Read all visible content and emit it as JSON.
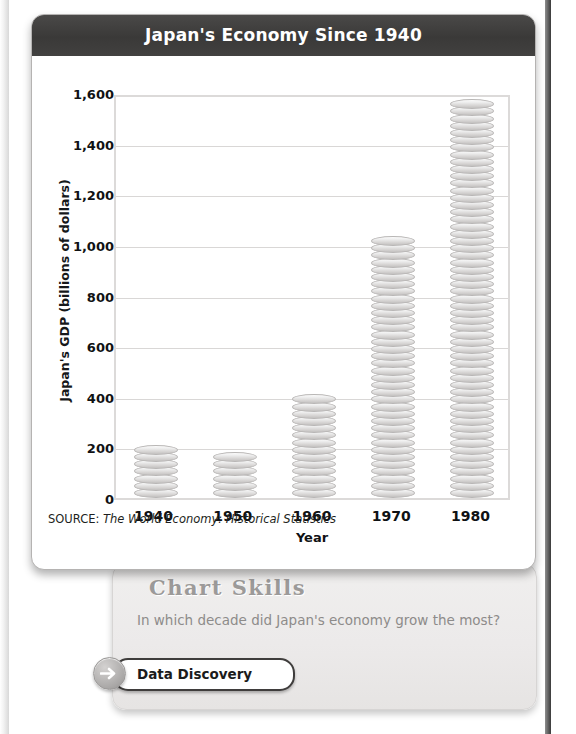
{
  "chart_card": {
    "title": "Japan's Economy Since 1940",
    "source_prefix": "SOURCE:",
    "source_title": "The World Economy: Historical Statistics"
  },
  "skills": {
    "heading": "Chart Skills",
    "question": "In which decade did Japan's economy grow the most?",
    "button_label": "Data Discovery",
    "arrow_icon": "arrow-right-icon"
  },
  "colors": {
    "title_bar": "#3a3938",
    "coin": "#d6d4d3",
    "gridline": "#d9d7d6",
    "panel": "#eceaea"
  },
  "chart_data": {
    "type": "bar",
    "title": "Japan's Economy Since 1940",
    "categories": [
      "1940",
      "1950",
      "1960",
      "1970",
      "1980"
    ],
    "values": [
      200,
      160,
      380,
      1010,
      1570
    ],
    "xlabel": "Year",
    "ylabel": "Japan's GDP (billions of dollars)",
    "ylim": [
      0,
      1600
    ],
    "yticks": [
      0,
      200,
      400,
      600,
      800,
      1000,
      1200,
      1400,
      1600
    ],
    "ytick_labels": [
      "0",
      "200",
      "400",
      "600",
      "800",
      "1,000",
      "1,200",
      "1,400",
      "1,600"
    ],
    "grid": true,
    "legend": null,
    "bar_style": "stacked-coins",
    "units": "billions of dollars",
    "source": "The World Economy: Historical Statistics"
  }
}
